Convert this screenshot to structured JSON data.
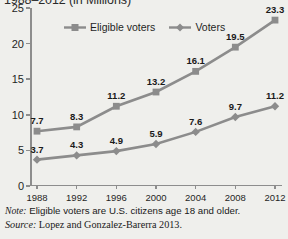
{
  "title": "1988–2012 (in Millions)",
  "legend": {
    "position": "top-center",
    "items": [
      {
        "label": "Eligible voters",
        "color": "#8c8c8c",
        "marker": "square"
      },
      {
        "label": "Voters",
        "color": "#8c8c8c",
        "marker": "diamond"
      }
    ]
  },
  "notes": {
    "note_lead": "Note:",
    "note_text": " Eligible voters are U.S. citizens age 18 and older.",
    "source_lead": "Source:",
    "source_text": " Lopez and Gonzalez-Barerra 2013."
  },
  "chart_data": {
    "type": "line",
    "title": "1988–2012 (in Millions)",
    "xlabel": "",
    "ylabel": "",
    "grid": false,
    "legend_position": "top-center",
    "categories": [
      "1988",
      "1992",
      "1996",
      "2000",
      "2004",
      "2008",
      "2012"
    ],
    "x": [
      1988,
      1992,
      1996,
      2000,
      2004,
      2008,
      2012
    ],
    "xlim": [
      1988,
      2012
    ],
    "ylim": [
      0,
      25
    ],
    "yticks": [
      0,
      5,
      10,
      15,
      20,
      25
    ],
    "ytick_labels": [
      "0",
      "5",
      "10",
      "15",
      "20",
      "25"
    ],
    "series": [
      {
        "name": "Eligible voters",
        "color": "#8c8c8c",
        "marker": "square",
        "values": [
          7.7,
          8.3,
          11.2,
          13.2,
          16.1,
          19.5,
          23.3
        ],
        "labels": [
          "7.7",
          "8.3",
          "11.2",
          "13.2",
          "16.1",
          "19.5",
          "23.3"
        ]
      },
      {
        "name": "Voters",
        "color": "#8c8c8c",
        "marker": "diamond",
        "values": [
          3.7,
          4.3,
          4.9,
          5.9,
          7.6,
          9.7,
          11.2
        ],
        "labels": [
          "3.7",
          "4.3",
          "4.9",
          "5.9",
          "7.6",
          "9.7",
          "11.2"
        ]
      }
    ]
  }
}
